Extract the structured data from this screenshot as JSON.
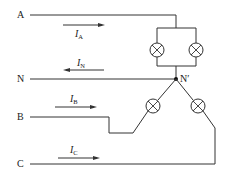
{
  "diagram": {
    "lines": {
      "A": {
        "label": "A"
      },
      "N": {
        "label": "N"
      },
      "B": {
        "label": "B"
      },
      "C": {
        "label": "C"
      }
    },
    "currents": {
      "IA": {
        "main": "I",
        "sub": "A",
        "direction": "right"
      },
      "IN": {
        "main": "I",
        "sub": "N",
        "direction": "left"
      },
      "IB": {
        "main": "I",
        "sub": "B",
        "direction": "right"
      },
      "IC": {
        "main": "I",
        "sub": "C",
        "direction": "right"
      }
    },
    "node": {
      "label": "N′"
    },
    "lamps": [
      {
        "id": "lamp-a1",
        "phase": "A"
      },
      {
        "id": "lamp-a2",
        "phase": "A"
      },
      {
        "id": "lamp-b",
        "phase": "B"
      },
      {
        "id": "lamp-c",
        "phase": "C"
      }
    ],
    "colors": {
      "wire": "#333333",
      "background": "#ffffff"
    }
  }
}
